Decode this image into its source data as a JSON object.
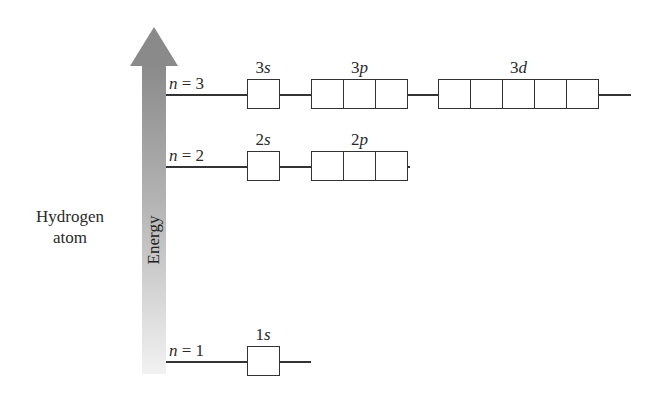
{
  "diagram": {
    "type": "energy-level-diagram",
    "atom_label_line1": "Hydrogen",
    "atom_label_line2": "atom",
    "axis_label": "Energy",
    "colors": {
      "arrow_top": "#8c8c8c",
      "arrow_bottom": "#f0f0f0",
      "lines": "#333333"
    },
    "levels": [
      {
        "n_label": "n",
        "n_eq": " = 3",
        "orbitals": [
          {
            "num": "3",
            "letter": "s",
            "boxes": 1
          },
          {
            "num": "3",
            "letter": "p",
            "boxes": 3
          },
          {
            "num": "3",
            "letter": "d",
            "boxes": 5
          }
        ]
      },
      {
        "n_label": "n",
        "n_eq": " = 2",
        "orbitals": [
          {
            "num": "2",
            "letter": "s",
            "boxes": 1
          },
          {
            "num": "2",
            "letter": "p",
            "boxes": 3
          }
        ]
      },
      {
        "n_label": "n",
        "n_eq": " = 1",
        "orbitals": [
          {
            "num": "1",
            "letter": "s",
            "boxes": 1
          }
        ]
      }
    ]
  }
}
